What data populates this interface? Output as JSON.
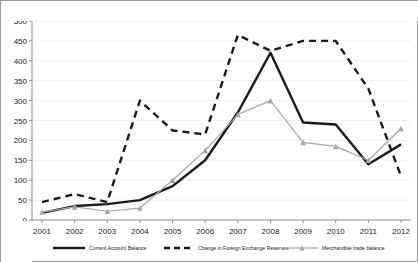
{
  "chart_data": {
    "type": "line",
    "title": "",
    "xlabel": "",
    "ylabel": "",
    "categories": [
      "2001",
      "2002",
      "2003",
      "2004",
      "2005",
      "2006",
      "2007",
      "2008",
      "2009",
      "2010",
      "2011",
      "2012"
    ],
    "ylim": [
      0,
      500
    ],
    "yticks": [
      0,
      50,
      100,
      150,
      200,
      250,
      300,
      350,
      400,
      450,
      500
    ],
    "grid": true,
    "legend_position": "bottom",
    "series": [
      {
        "name": "Current Account Balance",
        "style": "solid",
        "color": "#1a1a1a",
        "marker": "none",
        "values": [
          18,
          35,
          40,
          50,
          85,
          150,
          270,
          420,
          245,
          240,
          140,
          190
        ]
      },
      {
        "name": "Change in Foreign Exchange Reserves",
        "style": "dashed",
        "color": "#1a1a1a",
        "marker": "none",
        "values": [
          45,
          65,
          45,
          300,
          225,
          215,
          465,
          425,
          450,
          450,
          330,
          110
        ]
      },
      {
        "name": "Merchandise trade balance",
        "style": "solid",
        "color": "#a6a6a6",
        "marker": "triangle",
        "values": [
          20,
          33,
          22,
          30,
          100,
          175,
          265,
          300,
          195,
          185,
          150,
          230
        ]
      }
    ]
  },
  "axis": {
    "y_tick_labels": [
      "500",
      "450",
      "400",
      "350",
      "300",
      "250",
      "200",
      "150",
      "100",
      "50",
      "0"
    ],
    "x_tick_labels": [
      "2001",
      "2002",
      "2003",
      "2004",
      "2005",
      "2006",
      "2007",
      "2008",
      "2009",
      "2010",
      "2011",
      "2012"
    ]
  },
  "legend": {
    "items": [
      {
        "label": "Current Account Balance"
      },
      {
        "label": "Change in Foreign Exchange Reserves"
      },
      {
        "label": "Merchandise trade balance"
      }
    ]
  },
  "colors": {
    "series_primary": "#1a1a1a",
    "series_tertiary": "#a6a6a6",
    "grid": "#ededed",
    "axis": "#8c8c8c",
    "frame": "#9a9a9a"
  }
}
